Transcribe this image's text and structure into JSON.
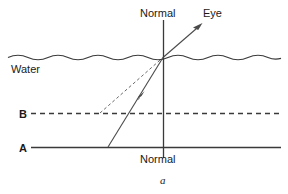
{
  "figure": {
    "caption": "a",
    "labels": {
      "normal_top": "Normal",
      "normal_bottom": "Normal",
      "eye": "Eye",
      "water": "Water",
      "line_b": "B",
      "line_a": "A"
    },
    "colors": {
      "ink": "#1a1a1a",
      "line": "#3a3a3a",
      "ray": "#4a4a4a",
      "background": "#ffffff"
    },
    "geometry": {
      "water_surface_y": 57,
      "line_b_y": 113,
      "line_a_y": 147,
      "normal_x": 163,
      "normal_top_y": 20,
      "normal_bottom_y": 158,
      "incidence_point_x": 163,
      "incidence_point_y": 57,
      "incident_ray_origin_x": 108,
      "incident_ray_origin_y": 147,
      "virtual_ray_origin_x": 100,
      "virtual_ray_origin_y": 113,
      "eye_ray_end_x": 201,
      "eye_ray_end_y": 24,
      "line_left_x": 30,
      "line_right_x": 281,
      "water_left_x": 8,
      "water_right_x": 281
    }
  }
}
